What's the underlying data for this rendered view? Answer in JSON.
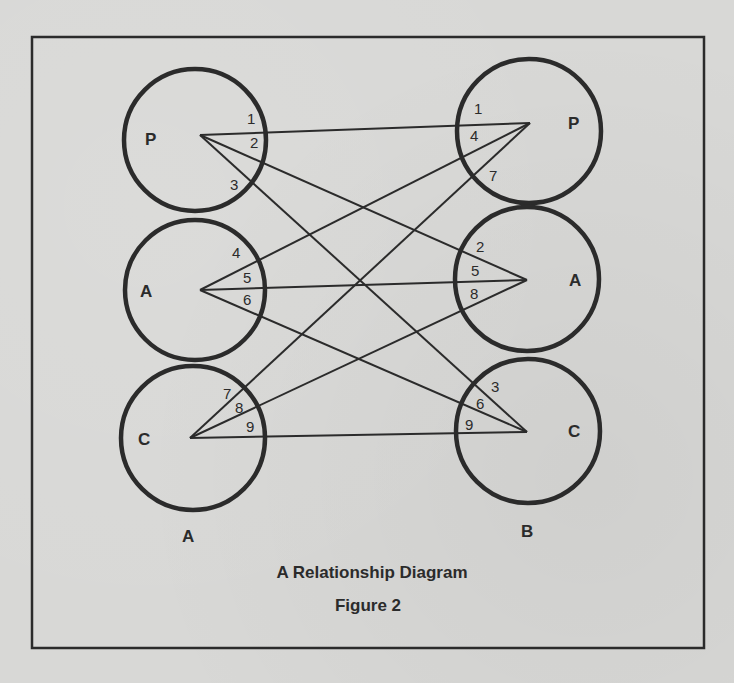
{
  "figure": {
    "title": "A Relationship Diagram",
    "caption": "Figure 2",
    "colors": {
      "ink": "#2b2b2b",
      "paper": "#d8d8d6"
    }
  },
  "groups": {
    "left": {
      "label": "A"
    },
    "right": {
      "label": "B"
    }
  },
  "nodes": {
    "left": [
      {
        "id": "P",
        "label": "P",
        "numbers": [
          "1",
          "2",
          "3"
        ]
      },
      {
        "id": "A",
        "label": "A",
        "numbers": [
          "4",
          "5",
          "6"
        ]
      },
      {
        "id": "C",
        "label": "C",
        "numbers": [
          "7",
          "8",
          "9"
        ]
      }
    ],
    "right": [
      {
        "id": "P",
        "label": "P",
        "numbers": [
          "1",
          "4",
          "7"
        ]
      },
      {
        "id": "A",
        "label": "A",
        "numbers": [
          "2",
          "5",
          "8"
        ]
      },
      {
        "id": "C",
        "label": "C",
        "numbers": [
          "3",
          "6",
          "9"
        ]
      }
    ]
  },
  "connections": [
    {
      "n": "1",
      "from": "A.P",
      "to": "B.P"
    },
    {
      "n": "2",
      "from": "A.P",
      "to": "B.A"
    },
    {
      "n": "3",
      "from": "A.P",
      "to": "B.C"
    },
    {
      "n": "4",
      "from": "A.A",
      "to": "B.P"
    },
    {
      "n": "5",
      "from": "A.A",
      "to": "B.A"
    },
    {
      "n": "6",
      "from": "A.A",
      "to": "B.C"
    },
    {
      "n": "7",
      "from": "A.C",
      "to": "B.P"
    },
    {
      "n": "8",
      "from": "A.C",
      "to": "B.A"
    },
    {
      "n": "9",
      "from": "A.C",
      "to": "B.C"
    }
  ]
}
